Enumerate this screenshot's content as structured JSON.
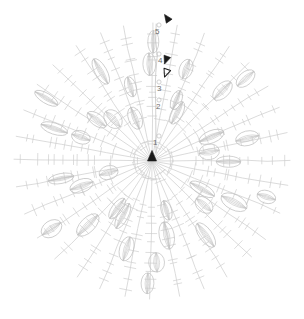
{
  "figure": {
    "type": "radial-tree-diagram",
    "title": "",
    "background_color": "#ffffff",
    "line_color": "#cfcfcf",
    "leaf_color": "#c4c4c4",
    "marker_color": "#1a1a1a",
    "label_color": "#6f6f6f",
    "center": {
      "x": 152,
      "y": 161
    },
    "outer_radius": 138,
    "spoke_count": 32
  },
  "axis": {
    "name": "radial-depth-axis",
    "orientation": "vertical",
    "direction": "outward-from-center",
    "x": 156,
    "ticks": [
      {
        "label": "5",
        "value": 5,
        "x": 155,
        "y": 28,
        "radius": 129
      },
      {
        "label": "4",
        "value": 4,
        "x": 158,
        "y": 57,
        "radius": 100
      },
      {
        "label": "3",
        "value": 3,
        "x": 157,
        "y": 85,
        "radius": 72
      },
      {
        "label": "2",
        "value": 2,
        "x": 156,
        "y": 103,
        "radius": 54
      },
      {
        "label": "1",
        "value": 1,
        "x": 153,
        "y": 139,
        "radius": 18
      }
    ]
  },
  "markers": [
    {
      "name": "marker-top-filled",
      "shape": "triangle",
      "filled": true,
      "x": 167,
      "y": 18,
      "size": 7,
      "rotation": -35
    },
    {
      "name": "marker-mid-filled",
      "shape": "triangle",
      "filled": true,
      "x": 166,
      "y": 60,
      "size": 7,
      "rotation": 200
    },
    {
      "name": "marker-mid-outline",
      "shape": "triangle",
      "filled": false,
      "x": 166,
      "y": 73,
      "size": 7,
      "rotation": 200
    },
    {
      "name": "marker-center-filled",
      "shape": "triangle",
      "filled": true,
      "x": 152,
      "y": 156,
      "size": 9,
      "rotation": 0
    }
  ],
  "chart_data": {
    "type": "scatter",
    "title": "",
    "xlabel": "",
    "ylabel": "",
    "categories": [
      "1",
      "2",
      "3",
      "4",
      "5"
    ],
    "values": [
      18,
      54,
      72,
      100,
      129
    ],
    "ylim": [
      0,
      138
    ],
    "grid": false,
    "legend": "none",
    "rings": [
      {
        "depth": 1,
        "radius": 18,
        "ticks_per_spoke": 1,
        "leaves": 0
      },
      {
        "depth": 2,
        "radius": 54,
        "ticks_per_spoke": 2,
        "leaves": 8
      },
      {
        "depth": 3,
        "radius": 72,
        "ticks_per_spoke": 2,
        "leaves": 10
      },
      {
        "depth": 4,
        "radius": 100,
        "ticks_per_spoke": 3,
        "leaves": 12
      },
      {
        "depth": 5,
        "radius": 129,
        "ticks_per_spoke": 3,
        "leaves": 6
      }
    ]
  }
}
